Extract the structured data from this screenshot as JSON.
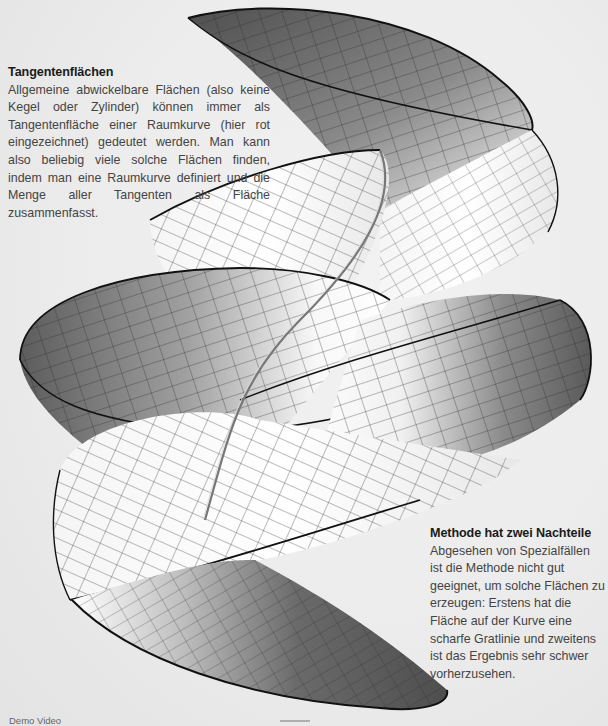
{
  "captions": {
    "left": {
      "title": "Tangentenflächen",
      "body": "Allgemeine abwickelbare Flächen (also keine Kegel oder Zylinder) können immer als Tangentenfläche einer Raumkurve (hier rot eingezeichnet) gedeutet werden. Man kann also beliebig viele solche Flächen finden, indem man eine Raumkurve definiert und die Menge aller Tangenten als Fläche zusammenfasst."
    },
    "right": {
      "title": "Methode hat zwei Nachteile",
      "body": "Abgesehen von Spezialfällen ist die Methode nicht gut geeignet, um solche Flächen zu erzeugen: Erstens hat die Fläche auf der Kurve eine scharfe Gratlinie und zweitens ist das Ergebnis sehr schwer vorherzusehen."
    }
  },
  "footer": {
    "label": "Demo Video"
  },
  "figure": {
    "colors": {
      "background": "#ebebeb",
      "surface_dark": "#5a5a5a",
      "surface_light": "#fafafa",
      "edge": "#111111",
      "grid": "#2a2a2a"
    }
  }
}
